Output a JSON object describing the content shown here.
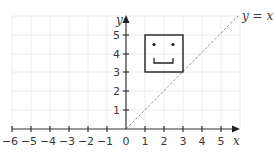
{
  "diagram": {
    "type": "coordinate-grid",
    "axes": {
      "x_label": "x",
      "y_label": "y",
      "x_ticks": [
        "−6",
        "−5",
        "−4",
        "−3",
        "−2",
        "−1",
        "0",
        "1",
        "2",
        "3",
        "4",
        "5"
      ],
      "y_ticks": [
        "1",
        "2",
        "3",
        "4",
        "5"
      ]
    },
    "mirror_line": {
      "label": "y = x",
      "style": "dashed"
    },
    "shape": {
      "name": "smiley-face square",
      "corners": [
        [
          1,
          3
        ],
        [
          3,
          3
        ],
        [
          3,
          5
        ],
        [
          1,
          5
        ]
      ],
      "eyes": [
        [
          1.5,
          4.5
        ],
        [
          2.5,
          4.5
        ]
      ],
      "mouth": "bracket smile"
    },
    "colors": {
      "grid": "#ececec",
      "axis": "#333333",
      "dashed_line": "#8a8a8a",
      "shape": "#222222"
    }
  }
}
